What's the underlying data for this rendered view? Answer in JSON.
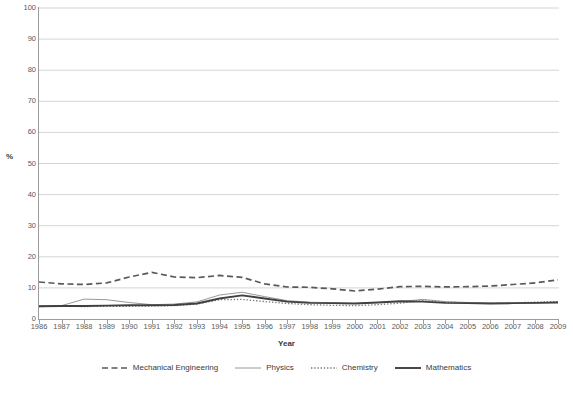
{
  "chart_data": {
    "type": "line",
    "title": "",
    "xlabel": "Year",
    "ylabel": "%",
    "ylim": [
      0,
      100
    ],
    "yticks": [
      0,
      10,
      20,
      30,
      40,
      50,
      60,
      70,
      80,
      90,
      100
    ],
    "grid": true,
    "legend_position": "bottom",
    "categories": [
      "1986",
      "1987",
      "1988",
      "1989",
      "1990",
      "1991",
      "1992",
      "1993",
      "1994",
      "1995",
      "1996",
      "1997",
      "1998",
      "1999",
      "2000",
      "2001",
      "2002",
      "2003",
      "2004",
      "2005",
      "2006",
      "2007",
      "2008",
      "2009"
    ],
    "series": [
      {
        "name": "Mechanical Engineering",
        "style": "dashed",
        "color": "#595959",
        "values": [
          11.9,
          11.3,
          11.1,
          11.6,
          13.5,
          15.0,
          13.5,
          13.3,
          14.0,
          13.4,
          11.3,
          10.3,
          10.2,
          9.7,
          9.0,
          9.6,
          10.4,
          10.5,
          10.3,
          10.4,
          10.6,
          11.1,
          11.6,
          12.6
        ]
      },
      {
        "name": "Physics",
        "style": "solid-thin",
        "color": "#8c8c8c",
        "values": [
          4.2,
          4.3,
          6.4,
          6.2,
          5.3,
          4.6,
          4.8,
          5.5,
          7.7,
          8.6,
          7.2,
          5.9,
          5.4,
          5.2,
          5.0,
          5.3,
          5.6,
          6.3,
          5.6,
          5.3,
          5.1,
          5.0,
          5.1,
          5.4
        ]
      },
      {
        "name": "Chemistry",
        "style": "dotted",
        "color": "#7a7a7a",
        "values": [
          4.0,
          4.1,
          4.0,
          4.1,
          4.1,
          4.2,
          4.3,
          4.8,
          6.2,
          6.3,
          5.6,
          5.0,
          4.6,
          4.4,
          4.3,
          4.6,
          5.1,
          5.9,
          5.4,
          5.2,
          5.0,
          5.2,
          5.4,
          5.6
        ]
      },
      {
        "name": "Mathematics",
        "style": "solid-thick",
        "color": "#404040",
        "values": [
          4.1,
          4.2,
          4.2,
          4.3,
          4.4,
          4.4,
          4.5,
          5.0,
          6.6,
          7.6,
          6.6,
          5.6,
          5.2,
          5.1,
          5.0,
          5.3,
          5.7,
          5.6,
          5.2,
          5.1,
          5.0,
          5.1,
          5.2,
          5.3
        ]
      }
    ]
  }
}
